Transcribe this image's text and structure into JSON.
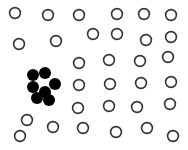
{
  "diagram": {
    "colors": {
      "background": "#ffffff",
      "open_stroke": "#333333",
      "open_fill": "#ffffff",
      "filled": "#000000"
    },
    "radius": 6,
    "stroke_width": 1.6,
    "open_circles": [
      [
        15,
        13
      ],
      [
        48,
        15
      ],
      [
        79,
        15
      ],
      [
        117,
        14
      ],
      [
        144,
        14
      ],
      [
        171,
        15
      ],
      [
        19,
        44
      ],
      [
        56,
        41
      ],
      [
        93,
        34
      ],
      [
        117,
        34
      ],
      [
        146,
        40
      ],
      [
        171,
        37
      ],
      [
        79,
        63
      ],
      [
        109,
        60
      ],
      [
        140,
        61
      ],
      [
        168,
        57
      ],
      [
        79,
        85
      ],
      [
        110,
        84
      ],
      [
        141,
        83
      ],
      [
        171,
        82
      ],
      [
        78,
        108
      ],
      [
        109,
        106
      ],
      [
        137,
        107
      ],
      [
        170,
        104
      ],
      [
        27,
        120
      ],
      [
        53,
        127
      ],
      [
        83,
        128
      ],
      [
        116,
        132
      ],
      [
        147,
        128
      ],
      [
        173,
        136
      ],
      [
        20,
        136
      ]
    ],
    "filled_circles": [
      [
        33,
        75
      ],
      [
        45,
        73
      ],
      [
        33,
        87
      ],
      [
        55,
        84
      ],
      [
        45,
        92
      ],
      [
        37,
        98
      ],
      [
        49,
        100
      ]
    ]
  }
}
